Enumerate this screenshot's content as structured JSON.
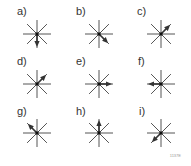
{
  "figure": {
    "id_label": "1137E",
    "stroke_color": "#555555",
    "center_color": "#111111",
    "arrow_color": "#333333",
    "spoke_length": 14,
    "panels": [
      {
        "label": "a)",
        "arrow_direction": "S",
        "angle_deg": 90,
        "cx": 37,
        "cy": 34,
        "lx": 17,
        "ly": 6
      },
      {
        "label": "b)",
        "arrow_direction": "SE",
        "angle_deg": 45,
        "cx": 99,
        "cy": 34,
        "lx": 76,
        "ly": 6
      },
      {
        "label": "c)",
        "arrow_direction": "NE",
        "angle_deg": -45,
        "cx": 161,
        "cy": 34,
        "lx": 137,
        "ly": 6
      },
      {
        "label": "d)",
        "arrow_direction": "NE",
        "angle_deg": -45,
        "cx": 37,
        "cy": 84,
        "lx": 17,
        "ly": 56
      },
      {
        "label": "e)",
        "arrow_direction": "E",
        "angle_deg": 0,
        "cx": 99,
        "cy": 84,
        "lx": 76,
        "ly": 56
      },
      {
        "label": "f)",
        "arrow_direction": "W",
        "angle_deg": 180,
        "cx": 161,
        "cy": 84,
        "lx": 138,
        "ly": 56
      },
      {
        "label": "g)",
        "arrow_direction": "NW",
        "angle_deg": -135,
        "cx": 37,
        "cy": 133,
        "lx": 17,
        "ly": 106
      },
      {
        "label": "h)",
        "arrow_direction": "N",
        "angle_deg": -90,
        "cx": 99,
        "cy": 133,
        "lx": 76,
        "ly": 106
      },
      {
        "label": "i)",
        "arrow_direction": "SW",
        "angle_deg": 135,
        "cx": 161,
        "cy": 133,
        "lx": 139,
        "ly": 106
      }
    ]
  }
}
